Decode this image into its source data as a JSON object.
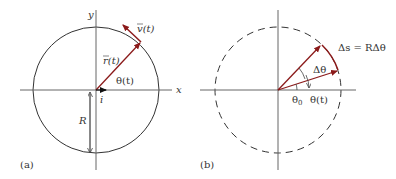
{
  "colors": {
    "vector": "#8b1a1a",
    "axis": "#555555",
    "circle": "#333333",
    "text": "#333333"
  },
  "panel_a": {
    "label": "(a)",
    "x_axis_label": "x",
    "y_axis_label": "y",
    "position_vector_label": "r(t)",
    "velocity_vector_label": "v(t)",
    "angle_label": "θ(t)",
    "unit_vector_label": "i",
    "radius_label": "R"
  },
  "panel_b": {
    "label": "(b)",
    "arc_length_label": "Δs = RΔθ",
    "delta_angle_label": "Δθ",
    "initial_angle_label": "θ",
    "initial_angle_subscript": "0",
    "angle_label": "θ(t)"
  }
}
